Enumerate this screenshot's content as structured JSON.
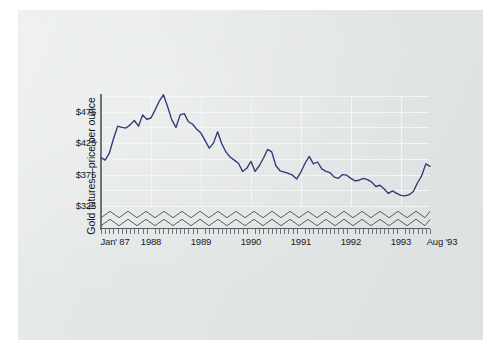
{
  "figure": {
    "background_color": "#ffffff",
    "panel_color": "#e3e6e6",
    "line_color": "#2b3a78",
    "grid_color": "#f4f6f6",
    "axis_color": "#5a6266"
  },
  "axis_title": {
    "y": "Gold futures—price per ounce"
  },
  "chart_data": {
    "type": "line",
    "title": "",
    "subtitle": "",
    "xlabel": "",
    "ylabel": "Gold futures—price per ounce",
    "legend": [],
    "legend_position": "none",
    "grid": true,
    "grid_major_step": 50,
    "grid_minor_step": 25,
    "broken_axis": true,
    "broken_axis_style": "double-zigzag",
    "ylim": [
      325,
      500
    ],
    "ytick_labels": [
      "$325",
      "$375",
      "$425",
      "$475"
    ],
    "ytick_values": [
      325,
      375,
      425,
      475
    ],
    "xtick_labels": [
      "Jan' 87",
      "1988",
      "1989",
      "1990",
      "1991",
      "1992",
      "1993",
      "Aug '93"
    ],
    "xtick_positions": [
      0,
      12,
      24,
      36,
      48,
      60,
      72,
      79
    ],
    "x_minor_tick_count": 80,
    "x_minor_tick_label": "monthly",
    "x_unit": "month",
    "x_start": "Jan 1987",
    "x_end": "Aug 1993",
    "series": [
      {
        "name": "Gold futures price per ounce",
        "color": "#2b3a78",
        "x": [
          0,
          1,
          2,
          3,
          4,
          5,
          6,
          7,
          8,
          9,
          10,
          11,
          12,
          13,
          14,
          15,
          16,
          17,
          18,
          19,
          20,
          21,
          22,
          23,
          24,
          25,
          26,
          27,
          28,
          29,
          30,
          31,
          32,
          33,
          34,
          35,
          36,
          37,
          38,
          39,
          40,
          41,
          42,
          43,
          44,
          45,
          46,
          47,
          48,
          49,
          50,
          51,
          52,
          53,
          54,
          55,
          56,
          57,
          58,
          59,
          60,
          61,
          62,
          63,
          64,
          65,
          66,
          67,
          68,
          69,
          70,
          71,
          72,
          73,
          74,
          75,
          76,
          77,
          78,
          79
        ],
        "values": [
          402,
          398,
          409,
          432,
          452,
          450,
          449,
          454,
          461,
          452,
          470,
          463,
          465,
          478,
          492,
          502,
          483,
          462,
          450,
          470,
          472,
          459,
          455,
          447,
          441,
          429,
          417,
          425,
          443,
          424,
          411,
          403,
          398,
          393,
          380,
          385,
          396,
          380,
          389,
          401,
          415,
          411,
          389,
          381,
          379,
          377,
          374,
          368,
          379,
          393,
          404,
          392,
          395,
          384,
          380,
          378,
          371,
          369,
          375,
          374,
          369,
          365,
          366,
          369,
          367,
          363,
          356,
          358,
          352,
          345,
          349,
          345,
          342,
          341,
          343,
          348,
          362,
          373,
          392,
          388
        ]
      }
    ]
  }
}
